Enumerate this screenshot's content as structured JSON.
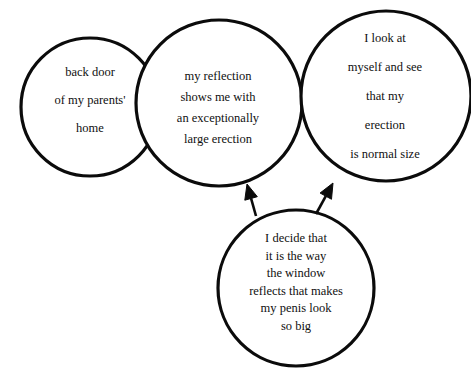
{
  "diagram": {
    "type": "vicious-cycle-circles",
    "background_color": "#ffffff",
    "stroke_color": "#0b0b0b",
    "text_color": "#101010",
    "nodes": [
      {
        "id": "node-1",
        "name": "situation-circle",
        "cx": 90,
        "cy": 107,
        "r": 69,
        "lines": [
          "back door",
          "of my parents'",
          "home"
        ]
      },
      {
        "id": "node-2",
        "name": "perception-circle",
        "cx": 219,
        "cy": 103,
        "r": 83,
        "lines": [
          "my reflection",
          "shows me with",
          "an exceptionally",
          "large erection"
        ]
      },
      {
        "id": "node-3",
        "name": "reality-check-circle",
        "cx": 386,
        "cy": 96,
        "r": 85,
        "lines": [
          "I look at",
          "myself and see",
          "that my",
          "erection",
          "is normal size"
        ]
      },
      {
        "id": "node-4",
        "name": "rationalisation-circle",
        "cx": 296,
        "cy": 288,
        "r": 78,
        "lines": [
          "I decide that",
          "it is the way",
          "the window",
          "reflects that makes",
          "my penis look",
          "so big"
        ]
      }
    ],
    "arrows": [
      {
        "id": "arrow-1",
        "name": "arrow-to-perception-circle",
        "from": "node-4",
        "to": "node-2",
        "tail_x": 256,
        "tail_y": 216,
        "tip_x": 247,
        "tip_y": 184
      },
      {
        "id": "arrow-2",
        "name": "arrow-to-reality-check-circle",
        "from": "node-4",
        "to": "node-3",
        "tail_x": 316,
        "tail_y": 214,
        "tip_x": 333,
        "tip_y": 183
      }
    ]
  }
}
